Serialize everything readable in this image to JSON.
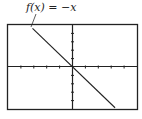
{
  "chart_data": {
    "type": "line",
    "title": "",
    "annotation": "f(x) = −x",
    "series": [
      {
        "name": "f(x) = −x",
        "x": [
          -10,
          10
        ],
        "y": [
          10,
          -10
        ]
      }
    ],
    "xlim": [
      -10,
      10
    ],
    "ylim": [
      -10,
      10
    ],
    "xlabel": "",
    "ylabel": "",
    "grid": false,
    "tick_spacing": 2
  },
  "label": {
    "text": "f(x) = −x"
  }
}
